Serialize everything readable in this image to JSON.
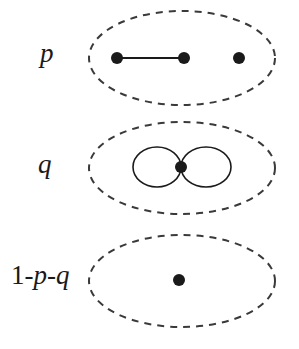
{
  "diagram": {
    "colors": {
      "ink": "#1a1a1a",
      "dash": "#3a3a3a",
      "background": "#ffffff"
    },
    "rows": [
      {
        "id": "row-p",
        "label_parts": [
          {
            "text": "p",
            "italic": true
          }
        ],
        "label_pos": {
          "x": 40,
          "y": 40
        },
        "ellipse": {
          "cx": 182,
          "cy": 58,
          "rx": 93,
          "ry": 47
        },
        "nodes": [
          {
            "x": 117,
            "y": 58,
            "r": 6
          },
          {
            "x": 184,
            "y": 58,
            "r": 6
          },
          {
            "x": 239,
            "y": 58,
            "r": 6
          }
        ],
        "edges": [
          {
            "from": 0,
            "to": 1
          }
        ],
        "loops": []
      },
      {
        "id": "row-q",
        "label_parts": [
          {
            "text": "q",
            "italic": true
          }
        ],
        "label_pos": {
          "x": 38,
          "y": 151
        },
        "ellipse": {
          "cx": 182,
          "cy": 168,
          "rx": 93,
          "ry": 46
        },
        "nodes": [
          {
            "x": 181,
            "y": 167,
            "r": 6
          }
        ],
        "edges": [],
        "loops": [
          {
            "cx": 157,
            "cy": 167,
            "rx": 24,
            "ry": 20
          },
          {
            "cx": 206,
            "cy": 167,
            "rx": 25,
            "ry": 20
          }
        ]
      },
      {
        "id": "row-1-p-q",
        "label_parts": [
          {
            "text": "1-",
            "italic": false
          },
          {
            "text": "p",
            "italic": true
          },
          {
            "text": "-",
            "italic": false
          },
          {
            "text": "q",
            "italic": true
          }
        ],
        "label_pos": {
          "x": 11,
          "y": 262
        },
        "ellipse": {
          "cx": 182,
          "cy": 281,
          "rx": 93,
          "ry": 46
        },
        "nodes": [
          {
            "x": 179,
            "y": 280,
            "r": 6
          }
        ],
        "edges": [],
        "loops": []
      }
    ]
  }
}
